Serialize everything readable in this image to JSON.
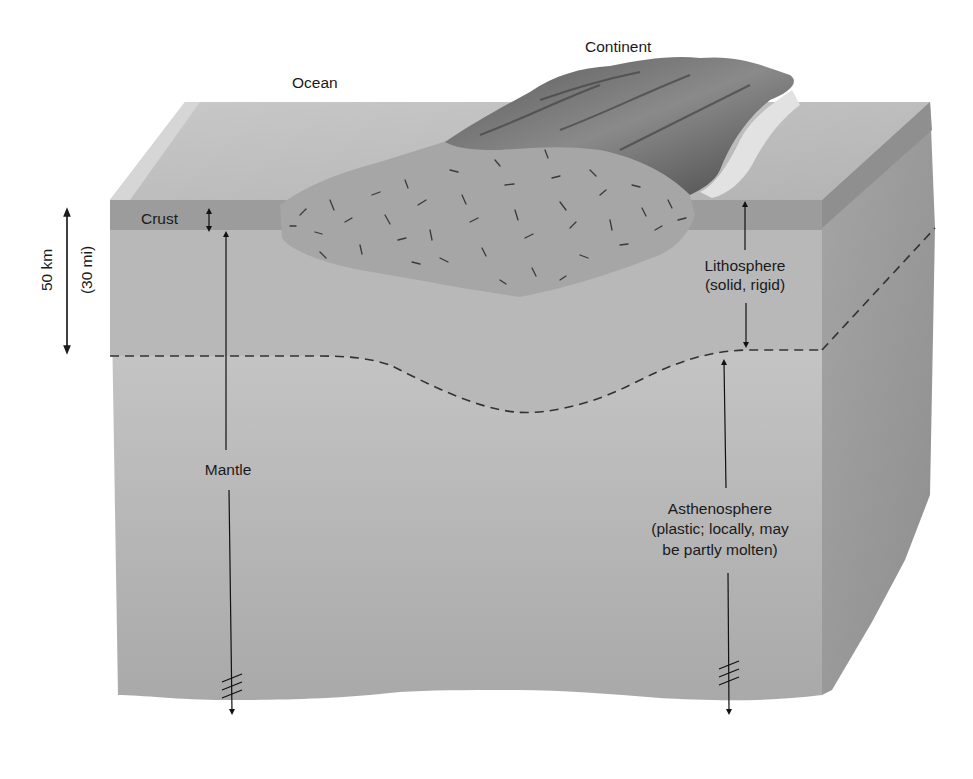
{
  "labels": {
    "ocean": "Ocean",
    "continent": "Continent",
    "crust": "Crust",
    "lithosphere_line1": "Lithosphere",
    "lithosphere_line2": "(solid, rigid)",
    "mantle": "Mantle",
    "asthenosphere_line1": "Asthenosphere",
    "asthenosphere_line2": "(plastic; locally, may",
    "asthenosphere_line3": "be partly molten)"
  },
  "scale_bar": {
    "metric": "50 km",
    "imperial": "(30 mi)"
  },
  "colors": {
    "top_surface": "#bdbdbd",
    "crust_band": "#9a9a9a",
    "lithosphere_front": "#b5b5b5",
    "asthenosphere_front": "#c6c6c6",
    "right_side": "#9e9e9e",
    "continental_crust": "#a8a8a8",
    "continent_relief": "#6e6e6e",
    "text": "#1a1a1a",
    "background": "#ffffff"
  }
}
